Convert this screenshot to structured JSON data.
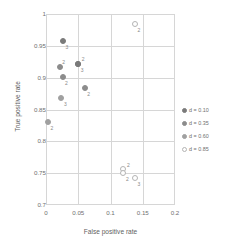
{
  "chart_data": {
    "type": "scatter",
    "title": "",
    "xlabel": "False positive rate",
    "ylabel": "True positive rate",
    "xlim": [
      0,
      0.2
    ],
    "ylim": [
      0.7,
      1
    ],
    "xticks": [
      "0",
      "0.05",
      "0.1",
      "0.15",
      "0.2"
    ],
    "xtick_values": [
      0,
      0.05,
      0.1,
      0.15,
      0.2
    ],
    "yticks": [
      "0.7",
      "0.75",
      "0.8",
      "0.85",
      "0.9",
      "0.95",
      "1"
    ],
    "ytick_values": [
      0.7,
      0.75,
      0.8,
      0.85,
      0.9,
      0.95,
      1
    ],
    "grid": true,
    "legend_position": "right",
    "legend": [
      {
        "label": "d = 0.10",
        "color": "#7a7a7a",
        "fill": "#7a7a7a"
      },
      {
        "label": "d = 0.35",
        "color": "#8c8c8c",
        "fill": "#8c8c8c"
      },
      {
        "label": "d = 0.60",
        "color": "#a0a0a0",
        "fill": "#a0a0a0"
      },
      {
        "label": "d = 0.85",
        "color": "#b4b4b4",
        "fill": "#ffffff"
      }
    ],
    "series": [
      {
        "name": "d = 0.10",
        "color": "#7a7a7a",
        "fill": "#7a7a7a",
        "points": [
          {
            "x": 0.026,
            "y": 0.958,
            "label": "3",
            "label_dx": 4,
            "label_dy": 6
          },
          {
            "x": 0.05,
            "y": 0.922,
            "label": "2",
            "label_dx": 5,
            "label_dy": -5
          },
          {
            "x": 0.05,
            "y": 0.922,
            "label": "3",
            "label_dx": 4,
            "label_dy": 6
          }
        ]
      },
      {
        "name": "d = 0.35",
        "color": "#8c8c8c",
        "fill": "#8c8c8c",
        "points": [
          {
            "x": 0.021,
            "y": 0.916,
            "label": "2",
            "label_dx": 4,
            "label_dy": -5
          },
          {
            "x": 0.027,
            "y": 0.901,
            "label": "2",
            "label_dx": 3,
            "label_dy": 6
          },
          {
            "x": 0.06,
            "y": 0.883,
            "label": "2",
            "label_dx": 4,
            "label_dy": 6
          }
        ]
      },
      {
        "name": "d = 0.60",
        "color": "#a0a0a0",
        "fill": "#a0a0a0",
        "points": [
          {
            "x": 0.024,
            "y": 0.868,
            "label": "3",
            "label_dx": 4,
            "label_dy": 6
          },
          {
            "x": 0.003,
            "y": 0.83,
            "label": "2",
            "label_dx": 4,
            "label_dy": 6
          }
        ]
      },
      {
        "name": "d = 0.85",
        "color": "#b4b4b4",
        "fill": "#ffffff",
        "points": [
          {
            "x": 0.138,
            "y": 0.985,
            "label": "2",
            "label_dx": 4,
            "label_dy": 6
          },
          {
            "x": 0.12,
            "y": 0.757,
            "label": "2",
            "label_dx": 5,
            "label_dy": -4
          },
          {
            "x": 0.12,
            "y": 0.75,
            "label": "2",
            "label_dx": 4,
            "label_dy": 6
          },
          {
            "x": 0.138,
            "y": 0.743,
            "label": "3",
            "label_dx": 4,
            "label_dy": 6
          }
        ]
      }
    ]
  }
}
